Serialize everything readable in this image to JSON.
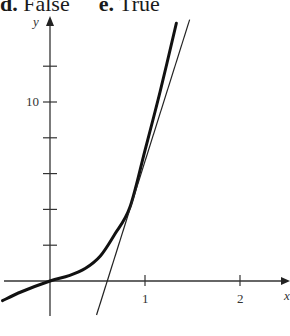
{
  "answers": [
    {
      "label": "d.",
      "value": "False"
    },
    {
      "label": "e.",
      "value": "True"
    }
  ],
  "chart_data": {
    "type": "line",
    "title": "",
    "xlabel": "x",
    "ylabel": "y",
    "x_ticks": [
      1,
      2
    ],
    "x_tick_labels": [
      "1",
      "2"
    ],
    "y_ticks": [
      2,
      4,
      6,
      8,
      10,
      12
    ],
    "y_tick_labels": [
      "",
      "",
      "",
      "",
      "10",
      ""
    ],
    "xlim": [
      -0.5,
      2.4
    ],
    "ylim": [
      -2,
      15
    ],
    "grid": false,
    "series": [
      {
        "name": "curve",
        "style": "thick",
        "x": [
          -0.5,
          -0.3,
          0,
          0.2,
          0.37,
          0.53,
          0.68,
          0.84,
          1.0,
          1.16,
          1.33
        ],
        "y": [
          -1.1,
          -0.6,
          0,
          0.3,
          0.7,
          1.4,
          2.6,
          4.1,
          7.3,
          10.6,
          14.4
        ]
      },
      {
        "name": "tangent line",
        "style": "thin",
        "x": [
          0.49,
          1.47
        ],
        "y": [
          -1.9,
          14.6
        ]
      }
    ]
  }
}
